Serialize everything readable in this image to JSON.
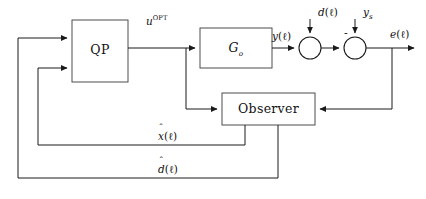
{
  "diagram": {
    "background_color": "#ffffff",
    "line_color": "#1a1a1a",
    "block_stroke_color": "#4d4d4d"
  },
  "blocks": [
    {
      "id": "qp",
      "label": "QP",
      "x": 72,
      "y": 20,
      "w": 56,
      "h": 62
    },
    {
      "id": "plant",
      "label": "G",
      "sub": "o",
      "x": 200,
      "y": 28,
      "w": 72,
      "h": 40
    },
    {
      "id": "observer",
      "label": "Observer",
      "x": 222,
      "y": 93,
      "w": 93,
      "h": 32
    }
  ],
  "summing_junctions": [
    {
      "id": "sum-disturbance",
      "cx": 310,
      "cy": 48,
      "r": 11,
      "sign": ""
    },
    {
      "id": "sum-error",
      "cx": 355,
      "cy": 48,
      "r": 11,
      "sign": "-"
    }
  ],
  "signals": {
    "u_opt": {
      "base": "u",
      "sup": "OPT",
      "text": "uOPT"
    },
    "y": {
      "base": "y",
      "arg": "(ℓ)",
      "text": "y(ℓ)"
    },
    "d": {
      "base": "d",
      "arg": "(ℓ)",
      "text": "d(ℓ)"
    },
    "y_s": {
      "base": "y",
      "sub": "s",
      "text": "ys"
    },
    "e": {
      "base": "e",
      "arg": "(ℓ)",
      "text": "e(ℓ)"
    },
    "x_hat": {
      "base": "x",
      "hat": "ˆ",
      "arg": "(ℓ)",
      "text": "x̂(ℓ)"
    },
    "d_hat": {
      "base": "d",
      "hat": "ˆ",
      "arg": "(ℓ)",
      "text": "d̂(ℓ)"
    },
    "minus": {
      "text": "-"
    }
  },
  "labels": {
    "qp": "QP",
    "plant_base": "G",
    "plant_sub": "o",
    "observer": "Observer",
    "u_opt_base": "u",
    "u_opt_sup": "OPT",
    "y_base": "y",
    "y_paren": "(ℓ)",
    "d_base": "d",
    "d_paren": "(ℓ)",
    "ys_base": "y",
    "ys_sub": "s",
    "e_base": "e",
    "e_paren": "(ℓ)",
    "xhat_base": "x",
    "xhat_mark": "ˆ",
    "xhat_paren": "(ℓ)",
    "dhat_base": "d",
    "dhat_mark": "ˆ",
    "dhat_paren": "(ℓ)",
    "minus": "-"
  }
}
